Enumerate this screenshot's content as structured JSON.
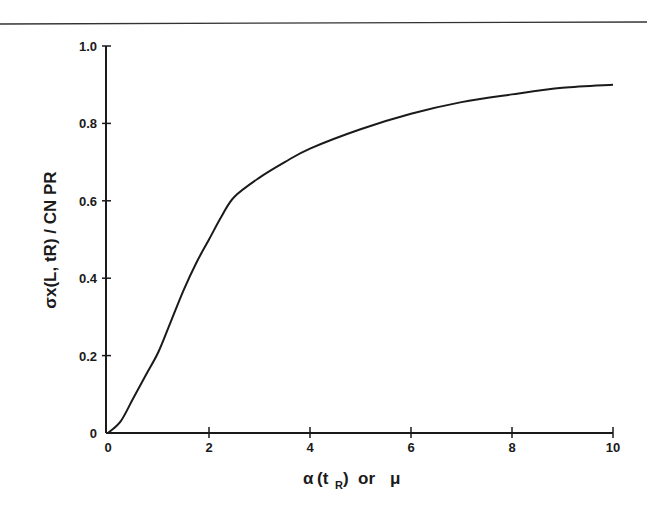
{
  "chart_data": {
    "type": "line",
    "title": "",
    "xlabel": "α (t_R) or μ",
    "ylabel": "σ_x(L, t_R) / C_N P_R",
    "xlim": [
      0,
      10
    ],
    "ylim": [
      0,
      1.0
    ],
    "grid": false,
    "legend": null,
    "x_ticks": [
      "0",
      "2",
      "4",
      "6",
      "8",
      "10"
    ],
    "y_ticks": [
      "0",
      "0.2",
      "0.4",
      "0.6",
      "0.8",
      "1.0"
    ],
    "series": [
      {
        "name": "curve",
        "x": [
          0,
          0.25,
          0.5,
          0.75,
          1.0,
          1.25,
          1.5,
          1.75,
          2.0,
          2.25,
          2.5,
          3.0,
          3.5,
          4.0,
          5.0,
          6.0,
          7.0,
          8.0,
          9.0,
          10.0
        ],
        "values": [
          0,
          0.03,
          0.09,
          0.15,
          0.21,
          0.29,
          0.37,
          0.44,
          0.5,
          0.56,
          0.61,
          0.66,
          0.7,
          0.735,
          0.785,
          0.825,
          0.855,
          0.875,
          0.892,
          0.9
        ]
      }
    ]
  },
  "labels": {
    "xlabel_main": "α",
    "xlabel_paren_open": "(t",
    "xlabel_sub": "R",
    "xlabel_paren_close": ")",
    "xlabel_or": "or",
    "xlabel_mu": "μ",
    "ylabel_text": "σx(L, tR) / CN PR"
  }
}
